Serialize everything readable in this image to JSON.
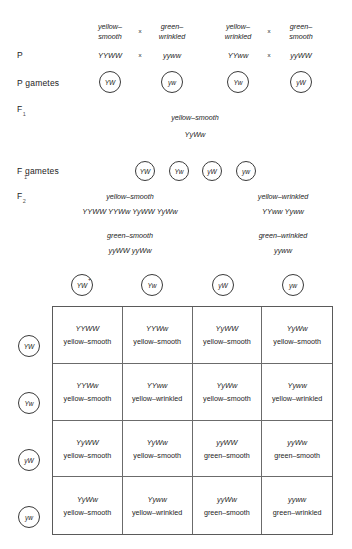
{
  "diagram": {
    "stage_labels": {
      "p": "P",
      "p_sub": "",
      "p_gametes": "P  gametes",
      "f1": "F",
      "f1_sub": "1",
      "f1_gametes": "F  gametes",
      "f1_gametes_sub": "1",
      "f2": "F",
      "f2_sub": "2"
    },
    "parental_crosses": [
      {
        "left_phenotype_line1": "yellow–",
        "left_phenotype_line2": "smooth",
        "right_phenotype_line1": "green–",
        "right_phenotype_line2": "wrinkled",
        "operator": "x",
        "left_genotype": "YYWW",
        "right_genotype": "yyww",
        "left_gamete": "YW",
        "right_gamete": "yw"
      },
      {
        "left_phenotype_line1": "yellow–",
        "left_phenotype_line2": "wrinkled",
        "right_phenotype_line1": "green–",
        "right_phenotype_line2": "smooth",
        "operator": "x",
        "left_genotype": "YYww",
        "right_genotype": "yyWW",
        "left_gamete": "Yw",
        "right_gamete": "yW"
      }
    ],
    "f1": {
      "phenotype": "yellow–smooth",
      "genotype": "YyWw"
    },
    "f1_gametes": [
      "YW",
      "Yw",
      "yW",
      "yw"
    ],
    "f2_summary": [
      {
        "phenotype": "yellow–smooth",
        "genotypes": "YYWW  YYWw  YyWW  YyWw"
      },
      {
        "phenotype": "yellow–wrinkled",
        "genotypes": "YYww  Yyww"
      },
      {
        "phenotype": "green–smooth",
        "genotypes": "yyWW    yyWw"
      },
      {
        "phenotype": "green–wrinkled",
        "genotypes": "yyww"
      }
    ],
    "punnett": {
      "column_gametes": [
        "YW",
        "Yw",
        "yW",
        "yw"
      ],
      "row_gametes": [
        "YW",
        "Yw",
        "yW",
        "yw"
      ],
      "first_column_marker": "+",
      "cells": [
        {
          "genotype": "YYWW",
          "phenotype": "yellow–smooth"
        },
        {
          "genotype": "YYWw",
          "phenotype": "yellow–smooth"
        },
        {
          "genotype": "YyWW",
          "phenotype": "yellow–smooth"
        },
        {
          "genotype": "YyWw",
          "phenotype": "yellow–smooth"
        },
        {
          "genotype": "YYWw",
          "phenotype": "yellow–smooth"
        },
        {
          "genotype": "YYww",
          "phenotype": "yellow–wrinkled"
        },
        {
          "genotype": "YyWw",
          "phenotype": "yellow–smooth"
        },
        {
          "genotype": "Yyww",
          "phenotype": "yellow–wrinkled"
        },
        {
          "genotype": "YyWW",
          "phenotype": "yellow–smooth"
        },
        {
          "genotype": "YyWw",
          "phenotype": "yellow–smooth"
        },
        {
          "genotype": "yyWW",
          "phenotype": "green–smooth"
        },
        {
          "genotype": "yyWw",
          "phenotype": "green–smooth"
        },
        {
          "genotype": "YyWw",
          "phenotype": "yellow–smooth"
        },
        {
          "genotype": "Yyww",
          "phenotype": "yellow–wrinkled"
        },
        {
          "genotype": "yyWw",
          "phenotype": "green–smooth"
        },
        {
          "genotype": "yyww",
          "phenotype": "green–wrinkled"
        }
      ]
    }
  }
}
